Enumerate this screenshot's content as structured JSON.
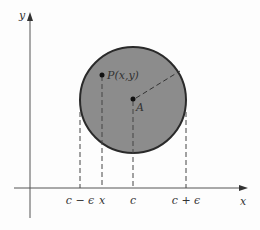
{
  "diagram": {
    "colors": {
      "background": "#fdfdfd",
      "axis": "#555555",
      "disk_fill": "#8c8c8c",
      "disk_stroke": "#2a2a2a",
      "dashed": "#444444",
      "text": "#333333"
    },
    "axes": {
      "x_label": "x",
      "y_label": "y"
    },
    "disk": {
      "center_label": "A",
      "point_label": "P(x,y)",
      "radius_style": "dashed"
    },
    "x_ticks": [
      {
        "label": "c − ϵ",
        "px": 80
      },
      {
        "label": "x",
        "px": 102
      },
      {
        "label": "c",
        "px": 133
      },
      {
        "label": "c + ϵ",
        "px": 186
      }
    ]
  }
}
